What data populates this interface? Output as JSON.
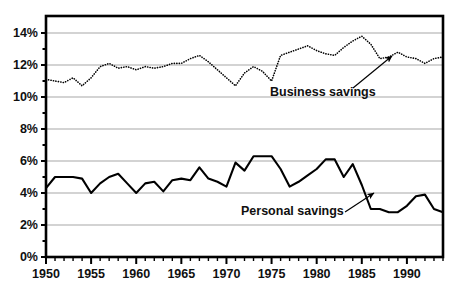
{
  "figure": {
    "name": "savings-rate-line-chart",
    "partial_title_top": "",
    "background_color": "#ffffff",
    "plot_frame_color": "#000000",
    "gridline_color": "#a8a8a8"
  },
  "chart_data": {
    "type": "line",
    "title": "",
    "subtitle": "",
    "xlabel": "",
    "ylabel": "",
    "grid": true,
    "grid_axis": "y",
    "legend": "none",
    "annotations": [
      {
        "name": "business-savings-annotation",
        "text": "Business savings",
        "text_x": 270,
        "text_y": 96,
        "arrow_from_x": 353,
        "arrow_from_y": 88,
        "arrow_to_x": 392,
        "arrow_to_y": 56
      },
      {
        "name": "personal-savings-annotation",
        "text": "Personal savings",
        "text_x": 241,
        "text_y": 215,
        "arrow_from_x": 345,
        "arrow_from_y": 212,
        "arrow_to_x": 374,
        "arrow_to_y": 193
      }
    ],
    "ylim": [
      0,
      15
    ],
    "ytick_values": [
      0,
      2,
      4,
      6,
      8,
      10,
      12,
      14
    ],
    "ytick_labels": [
      "0%",
      "2%",
      "4%",
      "6%",
      "8%",
      "10%",
      "12%",
      "14%"
    ],
    "xlim": [
      1950,
      1994
    ],
    "xtick_major_values": [
      1950,
      1955,
      1960,
      1965,
      1970,
      1975,
      1980,
      1985,
      1990
    ],
    "xtick_major_labels": [
      "1950",
      "1955",
      "1960",
      "1965",
      "1970",
      "1975",
      "1980",
      "1985",
      "1990"
    ],
    "xtick_minor_step": 1,
    "x": [
      1950,
      1951,
      1952,
      1953,
      1954,
      1955,
      1956,
      1957,
      1958,
      1959,
      1960,
      1961,
      1962,
      1963,
      1964,
      1965,
      1966,
      1967,
      1968,
      1969,
      1970,
      1971,
      1972,
      1973,
      1974,
      1975,
      1976,
      1977,
      1978,
      1979,
      1980,
      1981,
      1982,
      1983,
      1984,
      1985,
      1986,
      1987,
      1988,
      1989,
      1990,
      1991,
      1992,
      1993,
      1994
    ],
    "series": [
      {
        "name": "Business savings",
        "style": "dotted",
        "color": "#000000",
        "line_width": 1.6,
        "values": [
          11.1,
          11.0,
          10.9,
          11.2,
          10.7,
          11.2,
          11.9,
          12.1,
          11.8,
          11.9,
          11.7,
          11.9,
          11.8,
          11.9,
          12.1,
          12.1,
          12.4,
          12.6,
          12.2,
          11.7,
          11.2,
          10.7,
          11.5,
          11.9,
          11.6,
          11.0,
          12.6,
          12.8,
          13.0,
          13.2,
          12.9,
          12.7,
          12.6,
          13.1,
          13.5,
          13.8,
          13.3,
          12.4,
          12.5,
          12.8,
          12.5,
          12.4,
          12.1,
          12.4,
          12.5
        ]
      },
      {
        "name": "Personal savings",
        "style": "solid",
        "color": "#000000",
        "line_width": 2.1,
        "values": [
          4.3,
          5.0,
          5.0,
          5.0,
          4.9,
          4.0,
          4.6,
          5.0,
          5.2,
          4.6,
          4.0,
          4.6,
          4.7,
          4.1,
          4.8,
          4.9,
          4.8,
          5.6,
          4.9,
          4.7,
          4.4,
          5.9,
          5.4,
          6.3,
          6.3,
          6.3,
          5.5,
          4.4,
          4.7,
          5.1,
          5.5,
          6.1,
          6.1,
          5.0,
          5.8,
          4.5,
          3.0,
          3.0,
          2.8,
          2.8,
          3.2,
          3.8,
          3.9,
          3.0,
          2.8
        ]
      }
    ]
  }
}
